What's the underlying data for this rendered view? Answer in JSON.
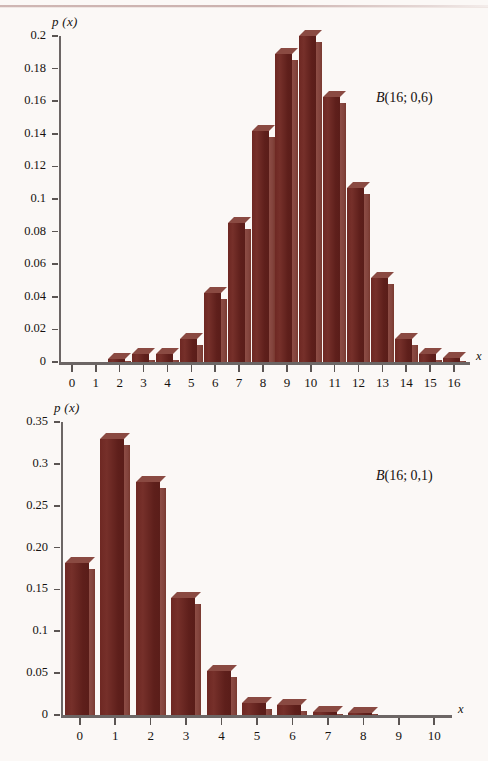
{
  "page": {
    "background_color": "#fbf8f6",
    "bar_front_color": "#6b2520",
    "bar_side_color": "#8b4a42",
    "axis_color": "#6c6665",
    "text_color": "#16120f"
  },
  "axis_letter_x": "x",
  "axis_title": "p (x)",
  "chart_data": [
    {
      "type": "bar",
      "id": "binomial-16-0.6",
      "title": "",
      "annotation": "B(16; 0,6)",
      "annotation_parts": {
        "symbol": "B",
        "args": "(16; 0,6)"
      },
      "xlabel": "x",
      "ylabel": "p (x)",
      "categories": [
        "0",
        "1",
        "2",
        "3",
        "4",
        "5",
        "6",
        "7",
        "8",
        "9",
        "10",
        "11",
        "12",
        "13",
        "14",
        "15",
        "16"
      ],
      "x": [
        0,
        1,
        2,
        3,
        4,
        5,
        6,
        7,
        8,
        9,
        10,
        11,
        12,
        13,
        14,
        15,
        16
      ],
      "values": [
        0.0,
        0.0,
        0.0017,
        0.0047,
        0.0049,
        0.0142,
        0.0426,
        0.0854,
        0.1417,
        0.1889,
        0.1997,
        0.1623,
        0.1069,
        0.0516,
        0.0139,
        0.0049,
        0.0022
      ],
      "ylim": [
        0,
        0.2
      ],
      "yticks": [
        0,
        0.02,
        0.04,
        0.06,
        0.08,
        0.1,
        0.12,
        0.14,
        0.16,
        0.18,
        0.2
      ],
      "yticklabels": [
        "0",
        "0.02",
        "0.04",
        "0.06",
        "0.08",
        "0.1",
        "0.12",
        "0.14",
        "0.16",
        "0.18",
        "0.2"
      ],
      "xlim": [
        0,
        16
      ],
      "grid": false,
      "legend": "none"
    },
    {
      "type": "bar",
      "id": "binomial-16-0.1",
      "title": "",
      "annotation": "B(16; 0,1)",
      "annotation_parts": {
        "symbol": "B",
        "args": "(16; 0,1)"
      },
      "xlabel": "x",
      "ylabel": "p (x)",
      "categories": [
        "0",
        "1",
        "2",
        "3",
        "4",
        "5",
        "6",
        "7",
        "8",
        "9",
        "10"
      ],
      "x": [
        0,
        1,
        2,
        3,
        4,
        5,
        6,
        7,
        8,
        9,
        10
      ],
      "values": [
        0.182,
        0.33,
        0.278,
        0.14,
        0.053,
        0.014,
        0.012,
        0.003,
        0.002,
        0.0,
        0.0
      ],
      "ylim": [
        0,
        0.35
      ],
      "yticks": [
        0,
        0.05,
        0.1,
        0.15,
        0.2,
        0.25,
        0.3,
        0.35
      ],
      "yticklabels": [
        "0",
        "0.05",
        "0.1",
        "0.15",
        "0.20",
        "0.25",
        "0.3",
        "0.35"
      ],
      "xlim": [
        0,
        10
      ],
      "grid": false,
      "legend": "none"
    }
  ]
}
